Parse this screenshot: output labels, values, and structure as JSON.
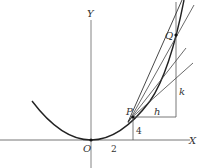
{
  "diagram": {
    "axes": {
      "x_label": "X",
      "y_label": "Y",
      "origin_label": "O"
    },
    "points": {
      "P": "P",
      "Q": "Q"
    },
    "dimensions": {
      "x_tick": "2",
      "y_height": "4",
      "dx": "h",
      "dy": "k"
    },
    "colors": {
      "line": "#444444",
      "curve": "#222222",
      "axis": "#666666"
    }
  }
}
